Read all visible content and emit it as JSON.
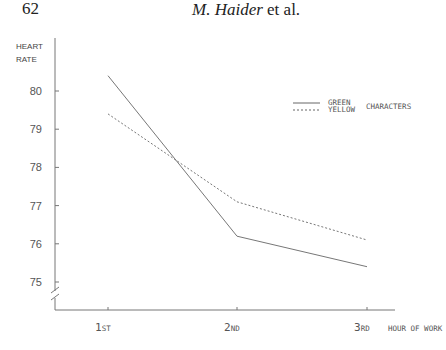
{
  "page": {
    "number": "62",
    "running_head_author": "M. Haider",
    "running_head_suffix": " et al."
  },
  "chart_data": {
    "type": "line",
    "title": "",
    "xlabel": "HOUR OF WORK",
    "ylabel": "HEART RATE",
    "categories": [
      "1ST",
      "2ND",
      "3RD"
    ],
    "category_labels": [
      {
        "big": "1",
        "small": "ST"
      },
      {
        "big": "2",
        "small": "ND"
      },
      {
        "big": "3",
        "small": "RD"
      }
    ],
    "yticks": [
      75,
      76,
      77,
      78,
      79,
      80
    ],
    "ylim": [
      74.3,
      81
    ],
    "axis_break": true,
    "grid": false,
    "legend_position": "upper right",
    "legend_suffix": "CHARACTERS",
    "series": [
      {
        "name": "GREEN",
        "style": "solid",
        "values": [
          80.4,
          76.2,
          75.4
        ]
      },
      {
        "name": "YELLOW",
        "style": "dashed",
        "values": [
          79.4,
          77.1,
          76.1
        ]
      }
    ]
  }
}
